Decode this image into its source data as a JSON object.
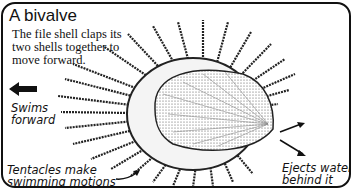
{
  "diagram": {
    "title": "A bivalve",
    "description": "The file shell claps its two shells together to move forward.",
    "labels": {
      "swims": "Swims forward",
      "tentacles": "Tentacles make swimming motions",
      "ejects": "Ejects water behind it"
    },
    "icons": [
      "left-arrow-icon",
      "pointer-arrow-icon",
      "water-jet-arrow-icon"
    ],
    "colors": {
      "ink": "#111111",
      "background": "#ffffff"
    }
  }
}
